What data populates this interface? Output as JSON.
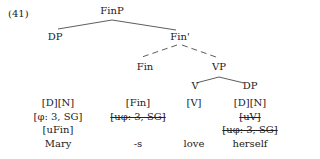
{
  "example_number": "(41)",
  "tree": {
    "root": "FinP",
    "spec": "DP",
    "fin_bar": "Fin'",
    "fin": "Fin",
    "vp": "VP",
    "v": "V",
    "obj": "DP"
  },
  "columns": {
    "mary": {
      "features": [
        "[D][N]",
        "[φ: 3, SG]",
        "[uFin]"
      ],
      "word": "Mary"
    },
    "fin": {
      "features": [
        "[Fin]",
        "[uφ: 3, SG]",
        ""
      ],
      "word": "-s"
    },
    "love": {
      "features": [
        "[V]",
        "",
        ""
      ],
      "word": "love"
    },
    "herself": {
      "features": [
        "[D][N]",
        "[uV]",
        "[uφ: 3, SG]"
      ],
      "word": "herself"
    }
  },
  "colors": {
    "text": "#222222",
    "line": "#333333",
    "background": "#ffffff"
  }
}
